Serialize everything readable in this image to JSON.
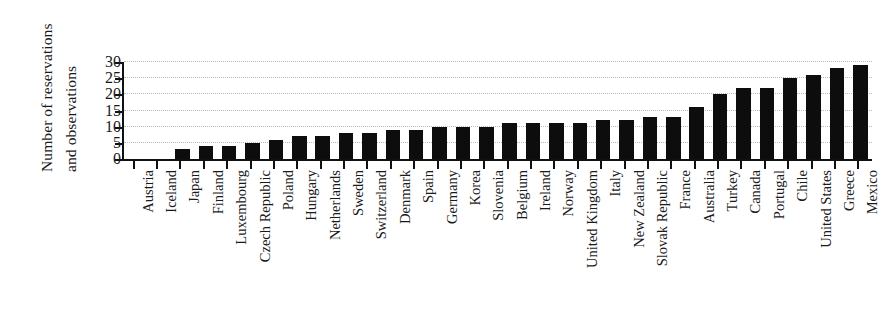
{
  "chart_data": {
    "type": "bar",
    "title": "",
    "xlabel": "",
    "ylabel": "Number of reservations and observations",
    "ylabel_lines": [
      "Number of reservations",
      "and observations"
    ],
    "ylim": [
      0,
      30
    ],
    "yticks": [
      0,
      5,
      10,
      15,
      20,
      25,
      30
    ],
    "ytick_labels": [
      "0",
      "5",
      "10",
      "15",
      "20",
      "25",
      "30"
    ],
    "grid": "horizontal-dotted",
    "legend": "none",
    "bar_color": "#0d0d0d",
    "categories": [
      "Austria",
      "Iceland",
      "Japan",
      "Finland",
      "Luxembourg",
      "Czech Republic",
      "Poland",
      "Hungary",
      "Netherlands",
      "Sweden",
      "Switzerland",
      "Denmark",
      "Spain",
      "Germany",
      "Korea",
      "Slovenia",
      "Belgium",
      "Ireland",
      "Norway",
      "United Kingdom",
      "Italy",
      "New Zealand",
      "Slovak Republic",
      "France",
      "Australia",
      "Turkey",
      "Canada",
      "Portugal",
      "Chile",
      "United States",
      "Greece",
      "Mexico"
    ],
    "values": [
      0,
      0,
      3,
      4,
      4,
      5,
      6,
      7,
      7,
      8,
      8,
      9,
      9,
      10,
      10,
      10,
      11,
      11,
      11,
      11,
      12,
      12,
      13,
      13,
      16,
      20,
      22,
      22,
      25,
      26,
      28,
      29
    ]
  }
}
